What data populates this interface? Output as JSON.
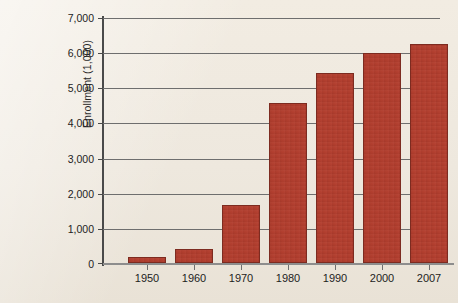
{
  "chart_data": {
    "type": "bar",
    "title": "",
    "xlabel": "",
    "ylabel": "Enrollment (1,000)",
    "categories": [
      "1950",
      "1960",
      "1970",
      "1980",
      "1990",
      "2000",
      "2007"
    ],
    "values": [
      170,
      390,
      1650,
      4560,
      5440,
      6000,
      6260
    ],
    "ylim": [
      0,
      7000
    ],
    "ytick_values": [
      0,
      1000,
      2000,
      3000,
      4000,
      5000,
      6000,
      7000
    ],
    "ytick_labels": [
      "0",
      "1,000",
      "2,000",
      "3,000",
      "4,000",
      "5,000",
      "6,000",
      "7,000"
    ],
    "grid": true,
    "legend": "none",
    "bar_color": "#b23e2e",
    "bar_edge_color": "#7d2b20",
    "background_color": "#efe9df",
    "gridline_color": "#6e6e6e",
    "axis_color": "#4a4a4a",
    "series": [
      {
        "name": "Enrollment",
        "values": [
          170,
          390,
          1650,
          4560,
          5440,
          6000,
          6260
        ]
      }
    ]
  }
}
